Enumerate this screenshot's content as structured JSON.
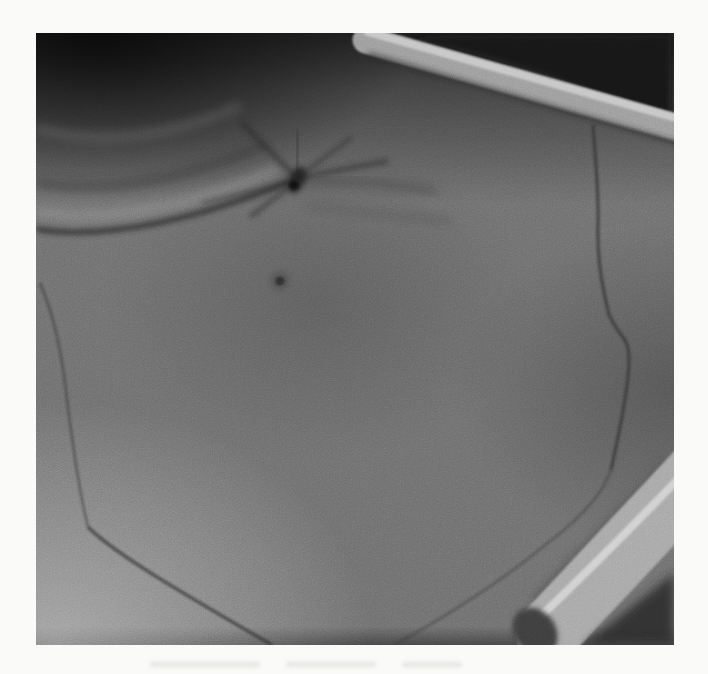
{
  "page": {
    "background_label": "white page margin around a printed photograph",
    "has_text": false
  },
  "figure": {
    "type": "grayscale clinical photograph",
    "alt": "Black-and-white close-up photograph of a skin surface: a puckered central scar with radiating creases at the top, a deep diagonal skin fold running to the left edge, a small dark mole below the scar, thin pre-operative surgical marker lines outlining a large area down both sides to the bottom edge, dark shadow across the top with a light tube crossing the upper-right corner, and a pale strap with a round opening entering from the lower-right corner.",
    "features": [
      {
        "name": "shadow-upper-area",
        "description": "dark shadow band across the top of the photograph, nearly black in the upper-right corner"
      },
      {
        "name": "tube-top-right",
        "description": "light rounded tubing crossing the darkened upper-right corner diagonally"
      },
      {
        "name": "puckered-scar",
        "description": "central puckered scar (umbilicus-like) with radiating dark creases"
      },
      {
        "name": "skin-fold-crease",
        "description": "deep diagonal crease from the scar to the left edge with a bright ridge below it"
      },
      {
        "name": "mole",
        "description": "small dark mole on the skin below the scar"
      },
      {
        "name": "surgical-marking-left",
        "description": "thin drawn marker line descending the left side and angling to the bottom edge"
      },
      {
        "name": "surgical-marking-right",
        "description": "thin wiggly drawn marker line descending the right side, bulging outward then curving down-left to the bottom edge"
      },
      {
        "name": "strap-bottom-right",
        "description": "pale strap with a bright upper edge and a dark round hole near its tip, entering from the lower-right corner"
      },
      {
        "name": "shadow-bottom-right",
        "description": "dark shadow wedge in the bottom-right corner beyond the strap"
      },
      {
        "name": "showthrough-marks",
        "description": "very faint gray show-through smudges on the page below the photograph"
      }
    ]
  },
  "colors": {
    "page_bg": "#fafaf8",
    "skin_mid": "#6e6e6e",
    "skin_light": "#c8c8c8",
    "skin_dark": "#4f4f4f",
    "shadow_black": "#141414",
    "top_shadow": "#1c1c1c",
    "marker_line": "#2e2e2e",
    "crease_dark": "#232323",
    "ridge_light": "#979797",
    "strap_light": "#a6a6a6",
    "strap_highlight": "#d4d4d4",
    "hole_dark": "#3c3c3c",
    "mole_color": "#2b2b2b",
    "tube_light": "#9b9b9b"
  }
}
